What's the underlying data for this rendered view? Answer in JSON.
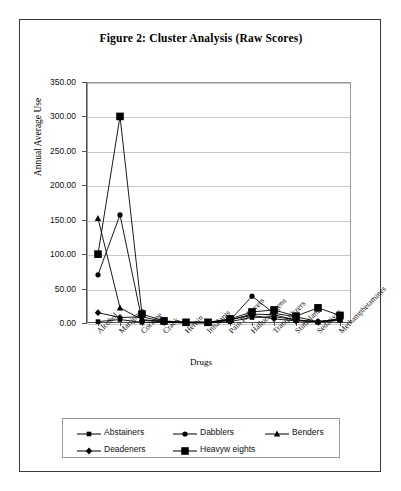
{
  "figure": {
    "title": "Figure 2: Cluster Analysis (Raw Scores)",
    "x_axis_title": "Drugs",
    "y_axis_title": "Annual Average Use"
  },
  "chart_data": {
    "type": "line",
    "title": "Figure 2: Cluster Analysis (Raw Scores)",
    "xlabel": "Drugs",
    "ylabel": "Annual Average Use",
    "ylim": [
      0,
      350
    ],
    "yticks": [
      0,
      50,
      100,
      150,
      200,
      250,
      300,
      350
    ],
    "ytick_labels": [
      "0.00",
      "50.00",
      "100.00",
      "150.00",
      "200.00",
      "250.00",
      "300.00",
      "350.00"
    ],
    "grid": true,
    "legend_position": "bottom",
    "categories": [
      "Alcohol",
      "Marijuana",
      "Cocaine",
      "Crack",
      "Heroin",
      "Inhalants",
      "Pain Relievers",
      "Hallucinogens",
      "Tranquilizers",
      "Stimulants",
      "Sedatives",
      "Methamphetamines"
    ],
    "series": [
      {
        "name": "Abstainers",
        "marker": "square",
        "values": [
          2,
          5,
          1,
          1,
          0,
          0,
          2,
          8,
          9,
          5,
          1,
          4
        ]
      },
      {
        "name": "Dabblers",
        "marker": "circle",
        "values": [
          70,
          157,
          4,
          2,
          1,
          1,
          4,
          39,
          14,
          9,
          2,
          6
        ]
      },
      {
        "name": "Benders",
        "marker": "triangle",
        "values": [
          152,
          22,
          5,
          2,
          1,
          1,
          4,
          13,
          12,
          4,
          2,
          5
        ]
      },
      {
        "name": "Deadeners",
        "marker": "diamond",
        "values": [
          15,
          8,
          9,
          2,
          1,
          1,
          5,
          11,
          6,
          3,
          2,
          5
        ]
      },
      {
        "name": "Heavyw eights",
        "marker": "bigsquare",
        "values": [
          100,
          300,
          13,
          3,
          1,
          1,
          6,
          16,
          19,
          10,
          22,
          11
        ]
      }
    ]
  },
  "legend": {
    "rows": [
      [
        {
          "label": "Abstainers",
          "marker": "square"
        },
        {
          "label": "Dabblers",
          "marker": "circle"
        },
        {
          "label": "Benders",
          "marker": "triangle"
        }
      ],
      [
        {
          "label": "Deadeners",
          "marker": "diamond"
        },
        {
          "label": "Heavyw eights",
          "marker": "bigsquare"
        }
      ]
    ]
  }
}
